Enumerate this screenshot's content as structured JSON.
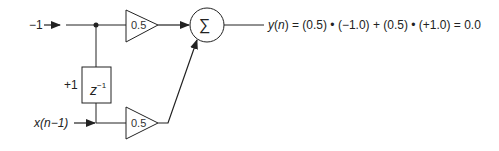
{
  "diagram": {
    "type": "FIR filter block diagram",
    "inputs": {
      "current_input_label": "−1",
      "delayed_input_label": "x(n−1)",
      "delay_initial_value_label": "+1"
    },
    "delay_block": {
      "label_base": "z",
      "label_exponent": "−1"
    },
    "amplifiers": [
      {
        "gain": "0.5"
      },
      {
        "gain": "0.5"
      }
    ],
    "summer": {
      "symbol": "∑"
    },
    "output": {
      "equation": "y(n) = (0.5) * (−1.0) + (0.5) * (+1.0) = 0.0",
      "y_symbol": "y",
      "n_symbol": "n",
      "rest": ") = (0.5) • (−1.0) + (0.5) • (+1.0) = 0.0"
    },
    "colors": {
      "line": "#222222",
      "background": "#ffffff"
    }
  }
}
